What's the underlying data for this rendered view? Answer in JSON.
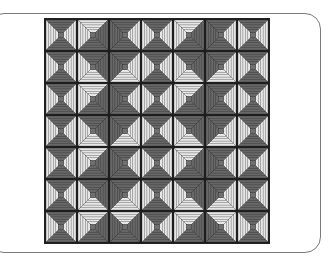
{
  "image": {
    "description": "Log cabin quilt pattern",
    "grid": {
      "rows": 7,
      "cols": 7
    },
    "colors": {
      "dark": "#676767",
      "light": "#e6e6e6",
      "line": "#2a2a2a",
      "center": "#6f6f6f",
      "frame": "#7a7a7a"
    },
    "strips_per_side": 5,
    "blocks": [
      [
        "dldl",
        "ldDl",
        "dldd",
        "dldl",
        "lddl",
        "dldd",
        "dldl"
      ],
      [
        "dldl",
        "ddll",
        "dlld",
        "dldl",
        "ddll",
        "dlld",
        "dldl"
      ],
      [
        "dldl",
        "lddl",
        "dldd",
        "dldl",
        "lddl",
        "dldd",
        "dldl"
      ],
      [
        "dldl",
        "ddll",
        "dlld",
        "dldl",
        "ddll",
        "dlld",
        "dldl"
      ],
      [
        "dldl",
        "lddl",
        "dldd",
        "dldl",
        "lddl",
        "dldd",
        "dldl"
      ],
      [
        "dldl",
        "ddll",
        "dlld",
        "dldl",
        "ddll",
        "dlld",
        "dldl"
      ],
      [
        "dldl",
        "lddl",
        "ldd d",
        "dldl",
        "lddl",
        "lldd",
        "dldl"
      ]
    ]
  }
}
